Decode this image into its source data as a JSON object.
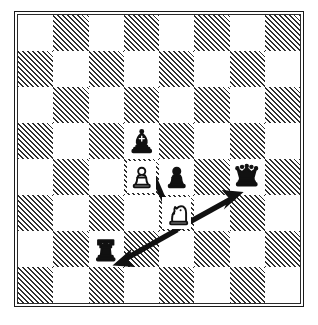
{
  "diagram": {
    "kind": "chess-diagram",
    "board": {
      "files": 8,
      "ranks": 8,
      "light_square_color": "#ffffff",
      "dark_square_color": "#2e2e2e",
      "dark_square_fill": "diagonal-hatch",
      "border_color": "#1a1a1a",
      "orientation": "white-bottom",
      "coordinates_shown": false,
      "labels_shown": false
    },
    "pieces": [
      {
        "id": "black-bishop",
        "name": "bishop",
        "color": "black",
        "glyph": "♝",
        "col": 3,
        "row": 3,
        "square_shade": "light"
      },
      {
        "id": "white-pawn",
        "name": "pawn",
        "color": "white",
        "glyph": "♙",
        "col": 3,
        "row": 4,
        "square_shade": "dark"
      },
      {
        "id": "black-pawn",
        "name": "pawn",
        "color": "black",
        "glyph": "♟",
        "col": 4,
        "row": 4,
        "square_shade": "light"
      },
      {
        "id": "black-queen",
        "name": "queen",
        "color": "black",
        "glyph": "♛",
        "col": 6,
        "row": 4,
        "square_shade": "light"
      },
      {
        "id": "white-knight",
        "name": "knight",
        "color": "white",
        "glyph": "♘",
        "col": 4,
        "row": 5,
        "square_shade": "dark"
      },
      {
        "id": "black-rook",
        "name": "rook",
        "color": "black",
        "glyph": "♜",
        "col": 2,
        "row": 6,
        "square_shade": "light"
      }
    ],
    "arrows": [
      {
        "id": "arrow-knight-to-bishop",
        "from": "white-knight",
        "to": "black-bishop",
        "direction": "up-left",
        "color": "#111111"
      },
      {
        "id": "arrow-knight-to-queen",
        "from": "white-knight",
        "to": "black-queen",
        "direction": "up-right",
        "color": "#111111"
      },
      {
        "id": "arrow-knight-to-rook",
        "from": "white-knight",
        "to": "black-rook",
        "direction": "down-left",
        "color": "#111111"
      }
    ]
  }
}
